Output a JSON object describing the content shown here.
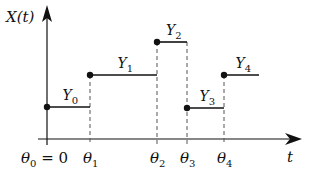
{
  "diagram": {
    "type": "step-function",
    "y_axis_label": "X(t)",
    "x_axis_label": "t",
    "colors": {
      "line": "#111111",
      "dashed": "#555555",
      "background": "#ffffff"
    },
    "ticks": [
      {
        "name": "θ",
        "sub": "0",
        "suffix": " = 0",
        "x": 47
      },
      {
        "name": "θ",
        "sub": "1",
        "suffix": "",
        "x": 90
      },
      {
        "name": "θ",
        "sub": "2",
        "suffix": "",
        "x": 157
      },
      {
        "name": "θ",
        "sub": "3",
        "suffix": "",
        "x": 187
      },
      {
        "name": "θ",
        "sub": "4",
        "suffix": "",
        "x": 224
      }
    ],
    "segments": [
      {
        "name": "Y",
        "sub": "0",
        "x1": 47,
        "x2": 90,
        "y": 107
      },
      {
        "name": "Y",
        "sub": "1",
        "x1": 90,
        "x2": 157,
        "y": 75
      },
      {
        "name": "Y",
        "sub": "2",
        "x1": 157,
        "x2": 187,
        "y": 42
      },
      {
        "name": "Y",
        "sub": "3",
        "x1": 187,
        "x2": 224,
        "y": 108
      },
      {
        "name": "Y",
        "sub": "4",
        "x1": 224,
        "x2": 259,
        "y": 75
      }
    ]
  }
}
